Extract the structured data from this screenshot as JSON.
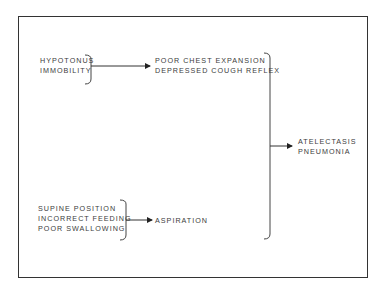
{
  "diagram": {
    "nodes": {
      "causes_top": {
        "lines": [
          "HYPOTONUS",
          "IMMOBILITY"
        ]
      },
      "effects_top": {
        "lines": [
          "POOR CHEST EXPANSION",
          "DEPRESSED COUGH REFLEX"
        ]
      },
      "causes_bottom": {
        "lines": [
          "SUPINE POSITION",
          "INCORRECT FEEDING",
          "POOR SWALLOWING"
        ]
      },
      "effect_bottom": {
        "lines": [
          "ASPIRATION"
        ]
      },
      "outcome": {
        "lines": [
          "ATELECTASIS",
          "PNEUMONIA"
        ]
      }
    },
    "edges": [
      {
        "from": "causes_top",
        "to": "effects_top"
      },
      {
        "from": "causes_bottom",
        "to": "effect_bottom"
      },
      {
        "from": [
          "effects_top",
          "effect_bottom"
        ],
        "to": "outcome"
      }
    ],
    "colors": {
      "line": "#333333",
      "text": "#3c3c3c",
      "background": "#ffffff"
    }
  }
}
